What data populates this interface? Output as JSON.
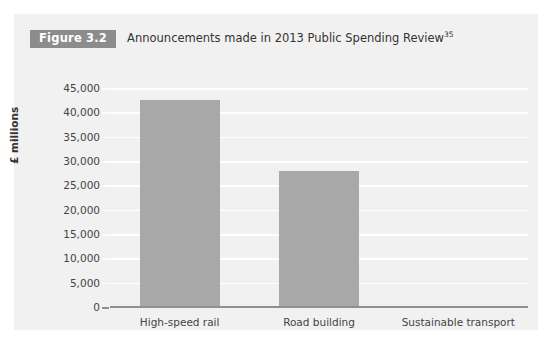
{
  "figure": {
    "badge": "Figure 3.2",
    "caption": "Announcements made in 2013 Public Spending Review",
    "footnote_marker": "35"
  },
  "chart_data": {
    "type": "bar",
    "title": "Announcements made in 2013 Public Spending Review",
    "categories": [
      "High-speed rail",
      "Road building",
      "Sustainable transport"
    ],
    "values": [
      42600,
      27900,
      300
    ],
    "series": [
      {
        "name": "Spending announced",
        "values": [
          42600,
          27900,
          300
        ]
      }
    ],
    "xlabel": "",
    "ylabel": "£ millions",
    "ylim": [
      0,
      45000
    ],
    "ytick_labels": [
      "0",
      "5,000",
      "10,000",
      "15,000",
      "20,000",
      "25,000",
      "30,000",
      "35,000",
      "40,000",
      "45,000"
    ],
    "ytick_values": [
      0,
      5000,
      10000,
      15000,
      20000,
      25000,
      30000,
      35000,
      40000,
      45000
    ],
    "grid": true,
    "legend": false,
    "colors": {
      "bar": "#a8a8a8",
      "panel_background": "#f1f1f1",
      "gridline": "#ffffff",
      "axis": "#8f8f8f",
      "badge_background": "#8c8c8c",
      "badge_text": "#ffffff",
      "text": "#444444"
    }
  }
}
